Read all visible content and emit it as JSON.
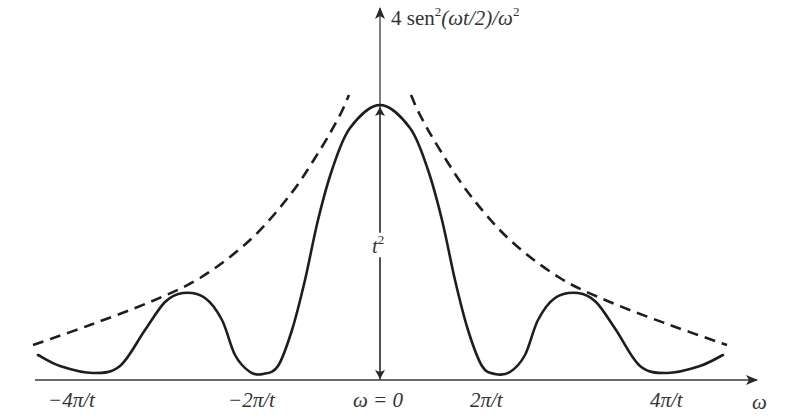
{
  "chart_data": {
    "type": "line",
    "title": "",
    "ylabel": "4 sen²(ωt/2)/ω²",
    "xlabel": "ω",
    "x_ticks": [
      {
        "value": -2,
        "label": "−4π/t"
      },
      {
        "value": -1,
        "label": "−2π/t"
      },
      {
        "value": 0,
        "label": "ω = 0"
      },
      {
        "value": 1,
        "label": "2π/t"
      },
      {
        "value": 2,
        "label": "4π/t"
      }
    ],
    "x_unit": "2π/t",
    "peak_annotation": "t²",
    "peak_value_label": "t²",
    "grid": false,
    "legend": null,
    "series": [
      {
        "name": "4 sen²(ωt/2)/ω²",
        "style": "solid",
        "points_px": [
          [
            38,
            355
          ],
          [
            60,
            366
          ],
          [
            93,
            373
          ],
          [
            120,
            366
          ],
          [
            145,
            330
          ],
          [
            165,
            302
          ],
          [
            183,
            293
          ],
          [
            205,
            298
          ],
          [
            222,
            320
          ],
          [
            235,
            355
          ],
          [
            250,
            372
          ],
          [
            263,
            374
          ],
          [
            278,
            366
          ],
          [
            292,
            330
          ],
          [
            305,
            280
          ],
          [
            318,
            220
          ],
          [
            332,
            170
          ],
          [
            350,
            128
          ],
          [
            380,
            105
          ],
          [
            410,
            128
          ],
          [
            428,
            170
          ],
          [
            442,
            220
          ],
          [
            455,
            280
          ],
          [
            468,
            330
          ],
          [
            482,
            366
          ],
          [
            495,
            374
          ],
          [
            510,
            372
          ],
          [
            525,
            355
          ],
          [
            538,
            320
          ],
          [
            555,
            298
          ],
          [
            578,
            293
          ],
          [
            596,
            302
          ],
          [
            616,
            330
          ],
          [
            640,
            366
          ],
          [
            667,
            373
          ],
          [
            700,
            366
          ],
          [
            723,
            355
          ]
        ]
      },
      {
        "name": "envelope 4/ω²",
        "style": "dashed",
        "points_px": [
          [
            33,
            345
          ],
          [
            90,
            325
          ],
          [
            150,
            302
          ],
          [
            200,
            278
          ],
          [
            250,
            240
          ],
          [
            290,
            195
          ],
          [
            320,
            150
          ],
          [
            340,
            115
          ],
          [
            349,
            95
          ]
        ]
      }
    ],
    "envelope_right_mirror": true
  },
  "labels": {
    "y_axis_title": "4 sen",
    "y_axis_title_sup": "2",
    "y_axis_title_mid": "(ωt/2)/ω",
    "y_axis_title_sup2": "2",
    "x_axis_title": "ω",
    "peak_height_base": "t",
    "peak_height_sup": "2",
    "tick_neg4": "−4π/t",
    "tick_neg2": "−2π/t",
    "tick_zero": "ω = 0",
    "tick_pos2": "2π/t",
    "tick_pos4": "4π/t"
  },
  "colors": {
    "curve": "#1e1e1e",
    "axis": "#3a3a3a",
    "text": "#333333"
  }
}
